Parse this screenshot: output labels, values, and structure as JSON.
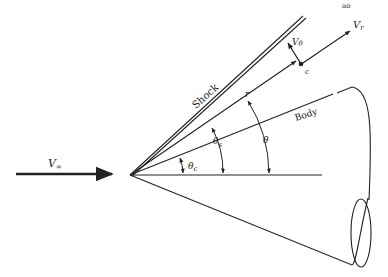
{
  "figure": {
    "type": "conical-flow-geometry",
    "top_fragment": "ao",
    "labels": {
      "freestream_velocity": "V",
      "freestream_sub": "∞",
      "shock": "Shock",
      "body": "Body",
      "ray": "r",
      "radial_velocity": "V",
      "radial_sub": "r",
      "tangential_velocity": "V",
      "tangential_sub": "θ",
      "point": "c",
      "theta": "θ",
      "theta_shock": "θ",
      "theta_shock_sub": "s",
      "theta_cone": "θ",
      "theta_cone_sub": "c"
    },
    "colors": {
      "ink": "#222222",
      "background": "#ffffff"
    }
  }
}
